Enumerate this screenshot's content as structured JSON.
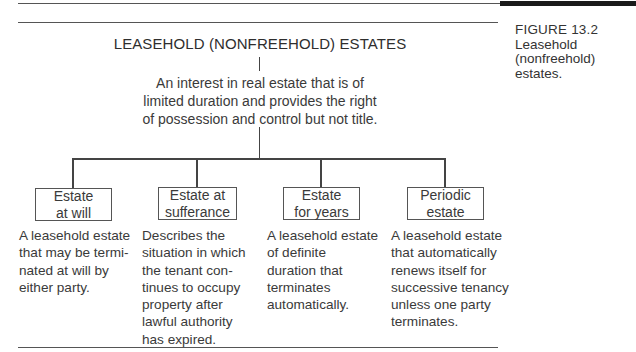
{
  "figure": {
    "label": "FIGURE  13.2",
    "caption_line1": "Leasehold",
    "caption_line2": "(nonfreehold) estates."
  },
  "diagram": {
    "root_title": "LEASEHOLD (NONFREEHOLD) ESTATES",
    "root_description": [
      "An interest in real estate that is of",
      "limited duration and provides the right",
      "of possession and control but not title."
    ],
    "children": [
      {
        "label_lines": [
          "Estate",
          "at will"
        ],
        "description": "A leasehold estate\nthat may be termi-\nnated at will by\neither party."
      },
      {
        "label_lines": [
          "Estate at",
          "sufferance"
        ],
        "description": "Describes the\nsituation in which\nthe tenant con-\ntinues to occupy\nproperty after\nlawful authority\nhas expired."
      },
      {
        "label_lines": [
          "Estate",
          "for years"
        ],
        "description": "A leasehold estate\nof definite\nduration that\nterminates\nautomatically."
      },
      {
        "label_lines": [
          "Periodic",
          "estate"
        ],
        "description": "A leasehold estate\nthat automatically\nrenews itself for\nsuccessive tenancy\nunless one party\nterminates."
      }
    ]
  }
}
